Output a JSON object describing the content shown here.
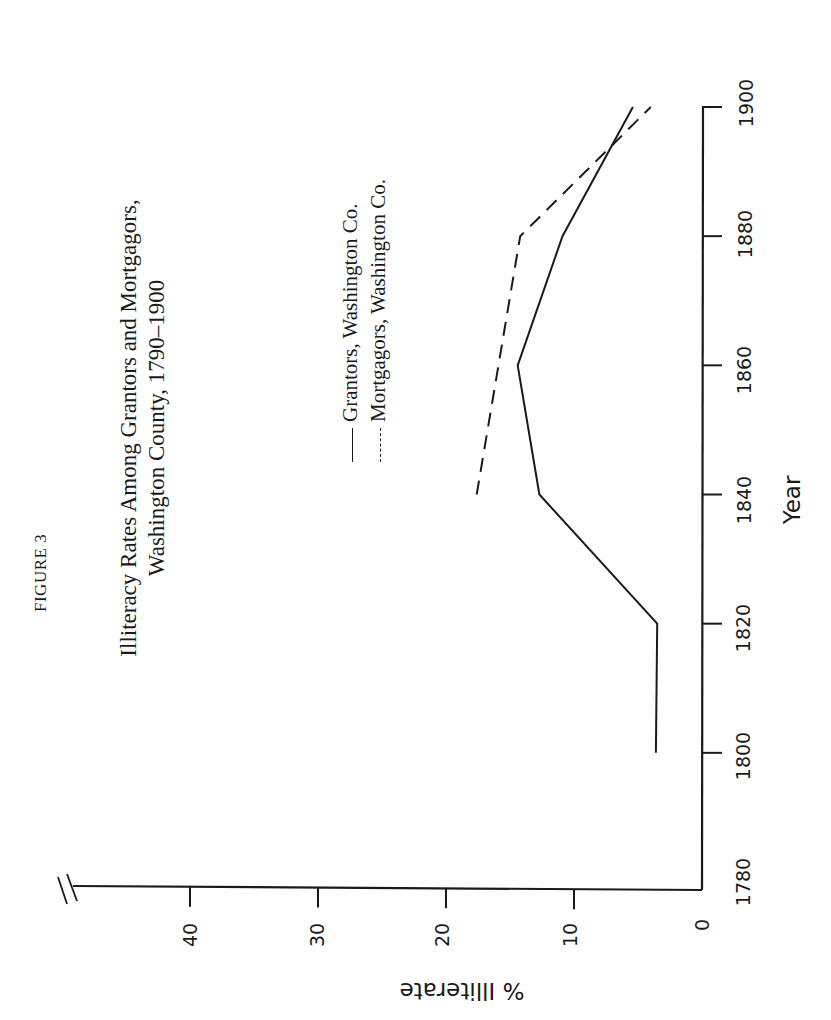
{
  "figure_label": "FIGURE 3",
  "title": {
    "line1": "Illiteracy Rates Among Grantors and Mortgagors,",
    "line2": "Washington County, 1790–1900"
  },
  "legend": {
    "grantors": {
      "marker": "——",
      "label": "Grantors, Washington Co."
    },
    "mortgagors": {
      "marker": "- - -",
      "label": "Mortgagors, Washington Co."
    }
  },
  "axes": {
    "x_title": "Year",
    "y_title": "% Illiterate",
    "x_ticks": [
      "1780",
      "1800",
      "1820",
      "1840",
      "1860",
      "1880",
      "1900"
    ],
    "y_ticks": [
      "0",
      "10",
      "20",
      "30",
      "40"
    ]
  },
  "colors": {
    "ink": "#1a1a1a",
    "background": "#ffffff"
  },
  "chart_data": {
    "type": "line",
    "title": "Illiteracy Rates Among Grantors and Mortgagors, Washington County, 1790–1900",
    "xlabel": "Year",
    "ylabel": "% Illiterate",
    "xlim": [
      1780,
      1900
    ],
    "ylim": [
      0,
      48
    ],
    "x_ticks": [
      1780,
      1800,
      1820,
      1840,
      1860,
      1880,
      1900
    ],
    "y_ticks": [
      0,
      10,
      20,
      30,
      40
    ],
    "grid": false,
    "axis_break_on_y": true,
    "orientation": "rotated 90° clockwise on page",
    "legend_position": "upper left (inside plot)",
    "series": [
      {
        "name": "Grantors, Washington Co.",
        "style": "solid",
        "x": [
          1800,
          1820,
          1840,
          1860,
          1880,
          1900
        ],
        "values": [
          3.6,
          3.5,
          12.7,
          14.4,
          10.9,
          5.4
        ]
      },
      {
        "name": "Mortgagors, Washington Co.",
        "style": "dashed",
        "x": [
          1840,
          1880,
          1900
        ],
        "values": [
          17.6,
          14.2,
          4.0
        ]
      }
    ]
  }
}
